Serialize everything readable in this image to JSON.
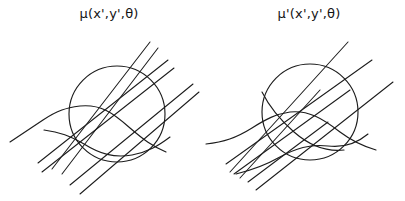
{
  "figure": {
    "background_color": "#ffffff",
    "stroke_color": "#1c1c1c",
    "caption_font_size_px": 13
  },
  "panels": [
    {
      "id": "panel-left",
      "label": "μ(x',y',θ)",
      "label_name": "mu-unprimed-label",
      "circle": {
        "cx": 117,
        "cy": 92,
        "r": 48
      },
      "ray_pairs": 3,
      "curves": 2,
      "description": "circle with three pairs of parallel straight rays and bending curved rays"
    },
    {
      "id": "panel-right",
      "label": "μ'(x',y',θ)",
      "label_name": "mu-primed-label",
      "circle": {
        "cx": 110,
        "cy": 90,
        "r": 48
      },
      "ray_pairs": 3,
      "curves": 3,
      "description": "circle with three pairs of parallel straight rays terminating and bending at the boundary"
    }
  ],
  "symbols": {
    "mu": "μ",
    "mu_prime": "μ'",
    "theta": "θ",
    "x_prime": "x'",
    "y_prime": "y'"
  }
}
